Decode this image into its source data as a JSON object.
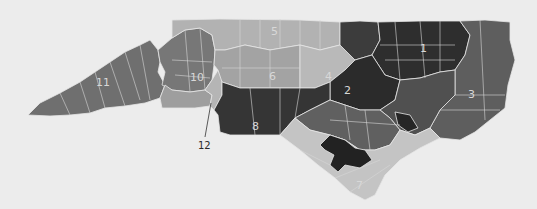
{
  "map": {
    "subject": "North Carolina congressional districts",
    "background": "#ececec",
    "districts": [
      {
        "id": "1",
        "label": "1",
        "shade": "#2e2e2e",
        "label_x": 423,
        "label_y": 52
      },
      {
        "id": "2",
        "label": "2",
        "shade": "#2b2b2b",
        "label_x": 347,
        "label_y": 92
      },
      {
        "id": "3",
        "label": "3",
        "shade": "#5e5e5e",
        "label_x": 472,
        "label_y": 97
      },
      {
        "id": "4",
        "label": "4",
        "shade": "#b9b9b9",
        "label_x": 328,
        "label_y": 78
      },
      {
        "id": "5",
        "label": "5",
        "shade": "#b2b2b2",
        "label_x": 274,
        "label_y": 35
      },
      {
        "id": "6",
        "label": "6",
        "shade": "#a3a3a3",
        "label_x": 273,
        "label_y": 78
      },
      {
        "id": "7",
        "label": "7",
        "shade": "#c4c4c4",
        "label_x": 359,
        "label_y": 187
      },
      {
        "id": "8",
        "label": "8",
        "shade": "#353535",
        "label_x": 256,
        "label_y": 128
      },
      {
        "id": "9",
        "label": "9",
        "shade": "#9e9e9e",
        "label_x": 196,
        "label_y": 98
      },
      {
        "id": "10",
        "label": "10",
        "shade": "#777777",
        "label_x": 196,
        "label_y": 81
      },
      {
        "id": "11",
        "label": "11",
        "shade": "#6f6f6f",
        "label_x": 100,
        "label_y": 86
      },
      {
        "id": "12",
        "label": "12",
        "shade": "#b5b5b5",
        "label_x": 203,
        "label_y": 148
      }
    ],
    "callout": {
      "district": "12",
      "text": "12"
    }
  }
}
